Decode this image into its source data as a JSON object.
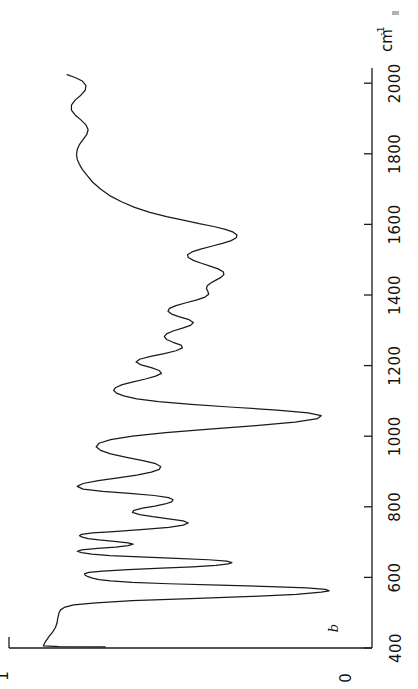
{
  "figure": {
    "kind": "ir-transmission-spectrum",
    "orientation": "rotated-90-ccw",
    "curve_label": "b",
    "background": "#ffffff",
    "line_color": "#1a1a1a"
  },
  "axes": {
    "wavenumber_axis": {
      "unit_mantissa": "cm",
      "unit_exponent": "-1",
      "tick_labels": [
        "400",
        "600",
        "800",
        "1000",
        "1200",
        "1400",
        "1600",
        "1800",
        "2000"
      ],
      "tick_values": [
        400,
        600,
        800,
        1000,
        1200,
        1400,
        1600,
        1800,
        2000
      ],
      "range": [
        400,
        2060
      ],
      "direction": "bottom-to-top-increasing"
    },
    "transmittance_axis": {
      "tick_labels": [
        "0",
        "1"
      ],
      "tick_values": [
        0,
        1
      ],
      "range": [
        0,
        1
      ],
      "direction": "right-to-left-increasing"
    }
  },
  "chart_data": {
    "type": "line",
    "title": "",
    "subtitle": "",
    "xlabel": "cm-1",
    "ylabel": "Transmittance",
    "xlim": [
      400,
      2060
    ],
    "ylim": [
      0,
      1.0
    ],
    "grid": false,
    "legend": "none",
    "annotations": [
      {
        "text": "b",
        "x": 455,
        "y": 0.12,
        "note": "curve identifier label"
      }
    ],
    "xticks": [
      400,
      600,
      800,
      1000,
      1200,
      1400,
      1600,
      1800,
      2000
    ],
    "xticklabels": [
      "400",
      "600",
      "800",
      "1000",
      "1200",
      "1400",
      "1600",
      "1800",
      "2000"
    ],
    "yticks": [
      0,
      1
    ],
    "yticklabels": [
      "0",
      "1"
    ],
    "series": [
      {
        "name": "b",
        "color": "#1a1a1a",
        "x": [
          403,
          404,
          406,
          412,
          420,
          432,
          445,
          458,
          470,
          482,
          492,
          500,
          508,
          515,
          522,
          528,
          534,
          540,
          546,
          552,
          558,
          562,
          566,
          570,
          574,
          578,
          582,
          586,
          590,
          594,
          598,
          602,
          606,
          610,
          614,
          618,
          622,
          626,
          630,
          634,
          638,
          642,
          646,
          650,
          654,
          658,
          662,
          666,
          670,
          674,
          678,
          682,
          686,
          690,
          694,
          698,
          702,
          706,
          710,
          714,
          718,
          722,
          726,
          730,
          736,
          742,
          748,
          754,
          760,
          766,
          772,
          778,
          784,
          790,
          796,
          802,
          808,
          814,
          820,
          826,
          832,
          838,
          844,
          850,
          858,
          866,
          874,
          882,
          890,
          898,
          906,
          914,
          922,
          930,
          940,
          950,
          960,
          970,
          980,
          990,
          1000,
          1010,
          1020,
          1030,
          1040,
          1050,
          1058,
          1066,
          1074,
          1082,
          1090,
          1098,
          1106,
          1114,
          1122,
          1130,
          1138,
          1146,
          1154,
          1162,
          1170,
          1178,
          1186,
          1194,
          1202,
          1210,
          1218,
          1226,
          1234,
          1242,
          1250,
          1258,
          1266,
          1274,
          1282,
          1290,
          1298,
          1306,
          1314,
          1322,
          1330,
          1338,
          1346,
          1354,
          1362,
          1370,
          1378,
          1386,
          1394,
          1402,
          1410,
          1418,
          1426,
          1434,
          1442,
          1450,
          1458,
          1466,
          1474,
          1482,
          1490,
          1498,
          1506,
          1514,
          1522,
          1530,
          1538,
          1546,
          1554,
          1562,
          1570,
          1578,
          1586,
          1594,
          1602,
          1612,
          1622,
          1634,
          1648,
          1664,
          1680,
          1700,
          1720,
          1740,
          1756,
          1770,
          1784,
          1798,
          1812,
          1826,
          1840,
          1854,
          1868,
          1882,
          1896,
          1910,
          1924,
          1938,
          1952,
          1966,
          1980,
          1994,
          2006,
          2016,
          2024
        ],
        "y": [
          0.735,
          0.862,
          0.905,
          0.903,
          0.898,
          0.89,
          0.88,
          0.872,
          0.868,
          0.866,
          0.864,
          0.862,
          0.858,
          0.848,
          0.822,
          0.76,
          0.66,
          0.5,
          0.33,
          0.208,
          0.14,
          0.118,
          0.128,
          0.18,
          0.28,
          0.42,
          0.56,
          0.66,
          0.72,
          0.752,
          0.77,
          0.782,
          0.79,
          0.792,
          0.78,
          0.742,
          0.672,
          0.58,
          0.494,
          0.43,
          0.396,
          0.386,
          0.4,
          0.45,
          0.54,
          0.64,
          0.722,
          0.772,
          0.8,
          0.812,
          0.8,
          0.756,
          0.706,
          0.672,
          0.658,
          0.672,
          0.71,
          0.752,
          0.782,
          0.798,
          0.806,
          0.8,
          0.77,
          0.712,
          0.628,
          0.56,
          0.52,
          0.506,
          0.52,
          0.56,
          0.604,
          0.64,
          0.66,
          0.656,
          0.632,
          0.598,
          0.57,
          0.552,
          0.548,
          0.56,
          0.6,
          0.668,
          0.742,
          0.796,
          0.812,
          0.796,
          0.754,
          0.7,
          0.648,
          0.608,
          0.586,
          0.582,
          0.596,
          0.628,
          0.676,
          0.72,
          0.748,
          0.76,
          0.752,
          0.72,
          0.66,
          0.568,
          0.448,
          0.32,
          0.212,
          0.15,
          0.14,
          0.176,
          0.262,
          0.382,
          0.498,
          0.588,
          0.648,
          0.684,
          0.704,
          0.712,
          0.706,
          0.688,
          0.658,
          0.624,
          0.596,
          0.58,
          0.586,
          0.608,
          0.636,
          0.65,
          0.64,
          0.61,
          0.572,
          0.54,
          0.522,
          0.526,
          0.548,
          0.566,
          0.572,
          0.566,
          0.548,
          0.522,
          0.5,
          0.492,
          0.504,
          0.53,
          0.552,
          0.562,
          0.558,
          0.54,
          0.512,
          0.482,
          0.46,
          0.45,
          0.452,
          0.456,
          0.454,
          0.444,
          0.43,
          0.416,
          0.408,
          0.41,
          0.424,
          0.446,
          0.47,
          0.492,
          0.506,
          0.508,
          0.496,
          0.472,
          0.442,
          0.412,
          0.388,
          0.374,
          0.372,
          0.382,
          0.404,
          0.436,
          0.476,
          0.52,
          0.566,
          0.612,
          0.654,
          0.69,
          0.72,
          0.748,
          0.77,
          0.786,
          0.798,
          0.806,
          0.812,
          0.814,
          0.812,
          0.806,
          0.796,
          0.786,
          0.782,
          0.788,
          0.802,
          0.818,
          0.828,
          0.828,
          0.818,
          0.802,
          0.79,
          0.788,
          0.798,
          0.818,
          0.84
        ]
      }
    ]
  }
}
